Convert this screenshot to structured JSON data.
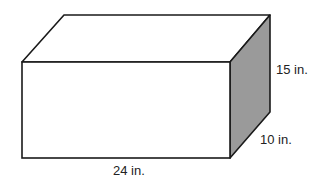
{
  "figure": {
    "type": "rectangular-prism",
    "dimensions": {
      "length": "24 in.",
      "height": "15 in.",
      "width": "10 in."
    },
    "colors": {
      "edge": "#1a1a1a",
      "side_face": "#9a9a9a",
      "front_face": "#ffffff",
      "top_face": "#ffffff"
    }
  }
}
